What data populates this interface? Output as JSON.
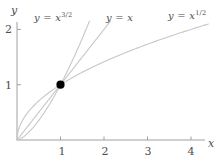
{
  "chart_data": {
    "type": "line",
    "title": "",
    "xlabel": "x",
    "ylabel": "y",
    "xlim": [
      0,
      4.4
    ],
    "ylim": [
      0,
      2.15
    ],
    "grid": false,
    "legend_position": "inline-curve-labels",
    "xticks": [
      "1",
      "2",
      "3",
      "4"
    ],
    "xtick_values": [
      1,
      2,
      3,
      4
    ],
    "yticks": [
      "1",
      "2"
    ],
    "ytick_values": [
      1,
      2
    ],
    "series": [
      {
        "name": "y = x^{3/2}",
        "label_base": "y = x",
        "label_exponent": "3/2",
        "exponent": 1.5,
        "color": "#c9c9c9",
        "x": [
          0,
          0.1,
          0.2,
          0.3,
          0.4,
          0.5,
          0.6,
          0.7,
          0.8,
          0.9,
          1.0,
          1.1,
          1.2,
          1.3,
          1.4,
          1.5,
          1.587
        ],
        "values": [
          0,
          0.032,
          0.089,
          0.164,
          0.253,
          0.354,
          0.465,
          0.586,
          0.715,
          0.854,
          1.0,
          1.154,
          1.315,
          1.482,
          1.657,
          1.837,
          2.0
        ]
      },
      {
        "name": "y = x",
        "label_base": "y = x",
        "label_exponent": "",
        "exponent": 1.0,
        "color": "#c9c9c9",
        "x": [
          0,
          0.5,
          1.0,
          1.5,
          2.0
        ],
        "values": [
          0,
          0.5,
          1.0,
          1.5,
          2.0
        ]
      },
      {
        "name": "y = x^{1/2}",
        "label_base": "y = x",
        "label_exponent": "1/2",
        "exponent": 0.5,
        "color": "#c9c9c9",
        "x": [
          0,
          0.1,
          0.2,
          0.4,
          0.6,
          0.8,
          1.0,
          1.4,
          1.8,
          2.2,
          2.6,
          3.0,
          3.4,
          3.8,
          4.0
        ],
        "values": [
          0,
          0.316,
          0.447,
          0.632,
          0.775,
          0.894,
          1.0,
          1.183,
          1.342,
          1.483,
          1.612,
          1.732,
          1.844,
          1.949,
          2.0
        ]
      }
    ],
    "marked_point": {
      "name": "intersection-point",
      "x": 1,
      "y": 1,
      "color": "#000000"
    }
  },
  "axes": {
    "y_name": "y",
    "x_name": "x",
    "axis_color": "#a0a0a0"
  }
}
